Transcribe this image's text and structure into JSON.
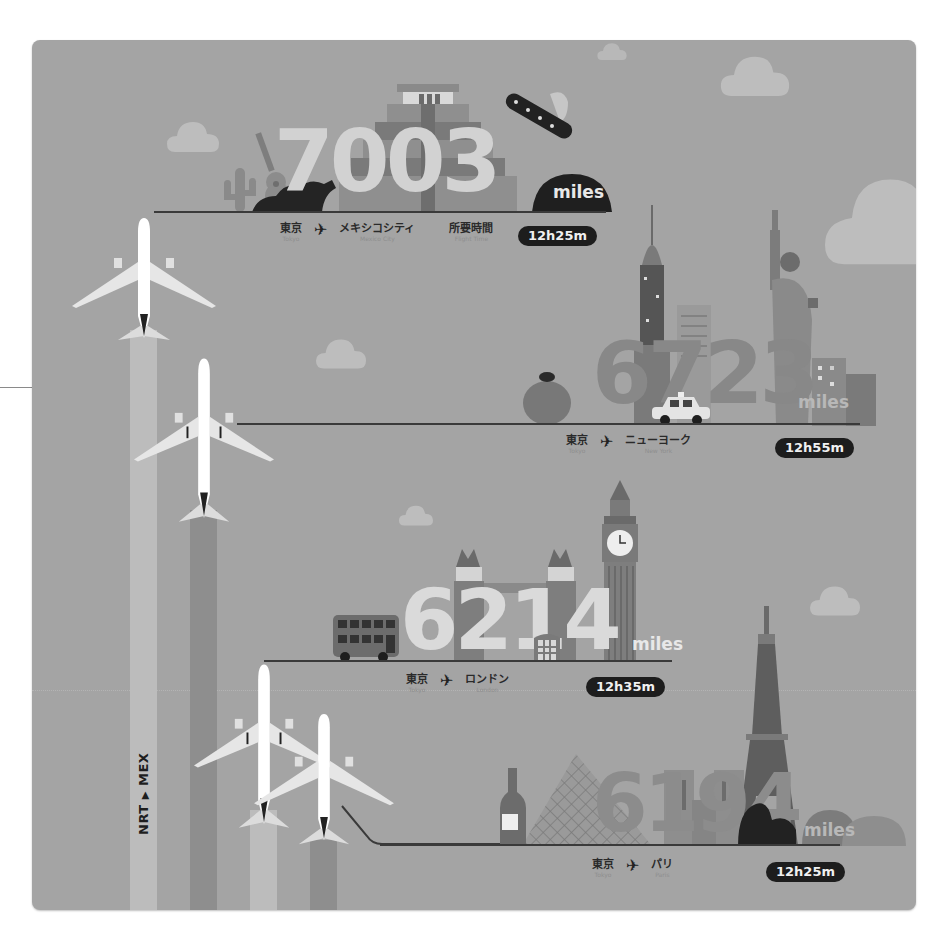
{
  "infographic": {
    "route_code": {
      "origin": "NRT",
      "arrow": "▶",
      "destination": "MEX"
    },
    "unit_label": "miles",
    "flight_time_label_jp": "所要時間",
    "flight_time_label_en": "Flight Time",
    "origin_jp": "東京",
    "origin_en": "Tokyo",
    "plane_icon": "✈",
    "colors": {
      "background": "#a4a4a4",
      "pill": "#1d1d1d",
      "ground_line": "#3a3a3a",
      "cloud": "#bdbdbd",
      "trail_light": "#bcbcbc",
      "trail_dark": "#8e8e8e"
    },
    "routes": [
      {
        "destination_jp": "メキシコシティ",
        "destination_en": "Mexico City",
        "distance": "7003",
        "flight_time": "12h25m"
      },
      {
        "destination_jp": "ニューヨーク",
        "destination_en": "New York",
        "distance": "6723",
        "flight_time": "12h55m"
      },
      {
        "destination_jp": "ロンドン",
        "destination_en": "London",
        "distance": "6214",
        "flight_time": "12h35m"
      },
      {
        "destination_jp": "パリ",
        "destination_en": "Paris",
        "distance": "6194",
        "flight_time": "12h25m"
      }
    ]
  }
}
